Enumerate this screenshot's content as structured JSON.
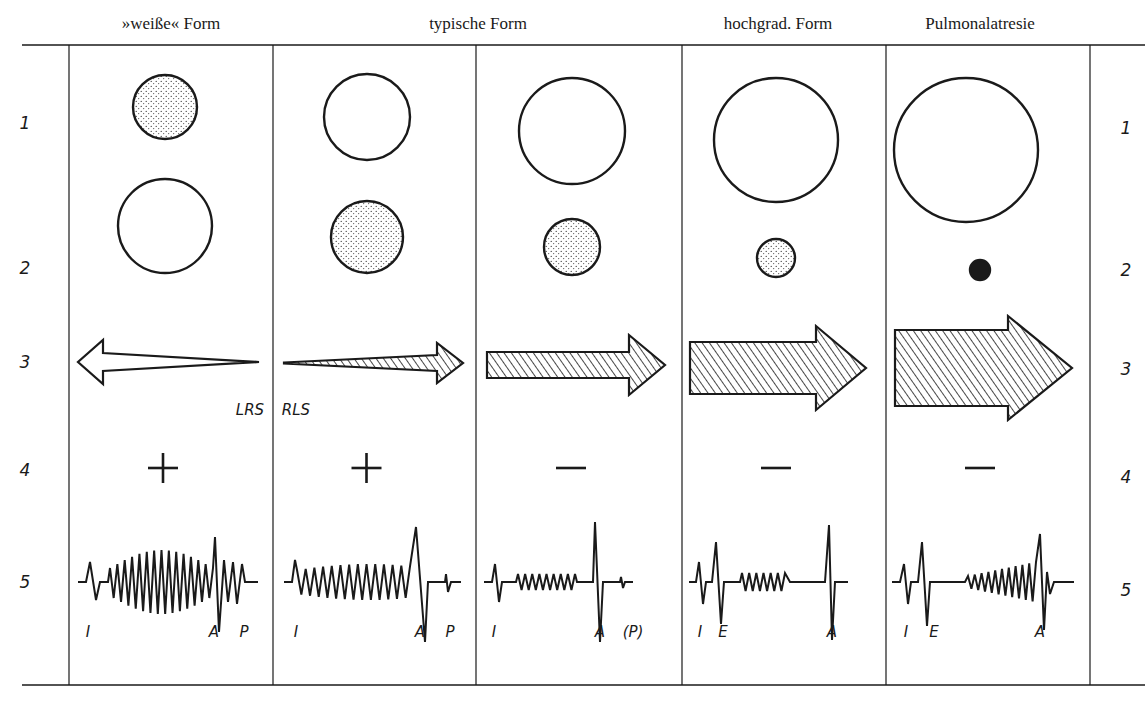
{
  "figure": {
    "columns": [
      {
        "title": "»weiße« Form",
        "center_x": 171
      },
      {
        "title": "typische Form",
        "center_x": 478
      },
      {
        "title": "hochgrad. Form",
        "center_x": 778
      },
      {
        "title": "Pulmonalatresie",
        "center_x": 980
      }
    ],
    "panels": [
      {
        "x0": 69,
        "x1": 273,
        "row1_circle": {
          "cx": 165,
          "cy": 107,
          "r": 32,
          "fill": "dotted"
        },
        "row2_circle": {
          "cx": 165,
          "cy": 226,
          "r": 47,
          "fill": "none"
        },
        "row3_arrow": {
          "direction": "left",
          "fill": "open",
          "tail_x": 259,
          "head_x": 78,
          "cy": 362,
          "shaft_half": 9,
          "head_half": 22,
          "head_len": 25
        },
        "shunt_label": {
          "text": "LRS",
          "x": 250,
          "y": 410
        },
        "row4_sign": "+",
        "row5_labels": [
          {
            "text": "I",
            "x": 88
          },
          {
            "text": "A",
            "x": 214
          },
          {
            "text": "P",
            "x": 244
          }
        ]
      },
      {
        "x0": 273,
        "x1": 476,
        "row1_circle": {
          "cx": 367,
          "cy": 117,
          "r": 43,
          "fill": "none"
        },
        "row2_circle": {
          "cx": 367,
          "cy": 237,
          "r": 36,
          "fill": "dotted"
        },
        "row3_arrow": {
          "direction": "right",
          "fill": "hatched",
          "tail_x": 284,
          "head_x": 463,
          "cy": 363,
          "shaft_half": 1,
          "head_half": 20,
          "head_len": 26,
          "taper": true
        },
        "shunt_label": {
          "text": "RLS",
          "x": 296,
          "y": 410
        },
        "row4_sign": "+",
        "row5_labels": [
          {
            "text": "I",
            "x": 296
          },
          {
            "text": "A",
            "x": 420
          },
          {
            "text": "P",
            "x": 450
          }
        ]
      },
      {
        "x0": 476,
        "x1": 682,
        "row1_circle": {
          "cx": 572,
          "cy": 131,
          "r": 53,
          "fill": "none"
        },
        "row2_circle": {
          "cx": 572,
          "cy": 247,
          "r": 28,
          "fill": "dotted"
        },
        "row3_arrow": {
          "direction": "right",
          "fill": "hatched",
          "tail_x": 487,
          "head_x": 665,
          "cy": 365,
          "shaft_half": 13,
          "head_half": 30,
          "head_len": 36
        },
        "shunt_label": null,
        "row4_sign": "−",
        "row5_labels": [
          {
            "text": "I",
            "x": 494
          },
          {
            "text": "A",
            "x": 600
          },
          {
            "text": "(P)",
            "x": 633
          }
        ]
      },
      {
        "x0": 682,
        "x1": 886,
        "row1_circle": {
          "cx": 776,
          "cy": 140,
          "r": 62,
          "fill": "none"
        },
        "row2_circle": {
          "cx": 776,
          "cy": 258,
          "r": 19,
          "fill": "dotted"
        },
        "row3_arrow": {
          "direction": "right",
          "fill": "hatched",
          "tail_x": 690,
          "head_x": 866,
          "cy": 368,
          "shaft_half": 26,
          "head_half": 42,
          "head_len": 50
        },
        "shunt_label": null,
        "row4_sign": "−",
        "row5_labels": [
          {
            "text": "I",
            "x": 700
          },
          {
            "text": "E",
            "x": 723
          },
          {
            "text": "A",
            "x": 832
          }
        ]
      },
      {
        "x0": 886,
        "x1": 1090,
        "row1_circle": {
          "cx": 966,
          "cy": 150,
          "r": 72,
          "fill": "none"
        },
        "row2_circle": {
          "cx": 980,
          "cy": 270,
          "r": 10,
          "fill": "solid"
        },
        "row3_arrow": {
          "direction": "right",
          "fill": "hatched",
          "tail_x": 895,
          "head_x": 1072,
          "cy": 368,
          "shaft_half": 38,
          "head_half": 52,
          "head_len": 64
        },
        "shunt_label": null,
        "row4_sign": "−",
        "row5_labels": [
          {
            "text": "I",
            "x": 906
          },
          {
            "text": "E",
            "x": 934
          },
          {
            "text": "A",
            "x": 1040
          }
        ]
      }
    ],
    "row_numbers": {
      "values": [
        "1",
        "2",
        "3",
        "4",
        "5"
      ],
      "left_x": 25,
      "right_x": 1126,
      "y_left": [
        123,
        268,
        362,
        470,
        582
      ],
      "y_right": [
        128,
        270,
        369,
        477,
        590
      ]
    },
    "frame": {
      "top_rule_y": 45,
      "bottom_rule_y": 685,
      "rule_x0": 22,
      "rule_x1": 1145,
      "dividers_x": [
        69,
        273,
        476,
        682,
        886,
        1090
      ]
    },
    "row4_y": 468,
    "row5_baseline_y": 582,
    "row5_label_y": 632,
    "ink_color": "#1a1a1a",
    "paper_color": "#ffffff"
  }
}
